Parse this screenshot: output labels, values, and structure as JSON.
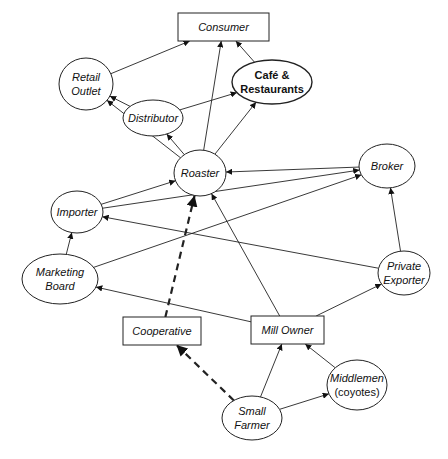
{
  "diagram": {
    "nodes": [
      {
        "id": "consumer",
        "label": [
          "Consumer"
        ],
        "shape": "rect",
        "x": 178,
        "y": 13,
        "w": 91,
        "h": 28,
        "style": "italic"
      },
      {
        "id": "retail",
        "label": [
          "Retail",
          "Outlet"
        ],
        "shape": "ellipse",
        "cx": 86,
        "cy": 84,
        "rx": 27,
        "ry": 26,
        "style": "italic"
      },
      {
        "id": "cafe",
        "label": [
          "Café &",
          "Restaurants"
        ],
        "shape": "ellipse",
        "cx": 272,
        "cy": 82,
        "rx": 40,
        "ry": 22,
        "style": "bold"
      },
      {
        "id": "distributor",
        "label": [
          "Distributor"
        ],
        "shape": "ellipse",
        "cx": 153,
        "cy": 118,
        "rx": 30,
        "ry": 18,
        "style": "italic"
      },
      {
        "id": "roaster",
        "label": [
          "Roaster"
        ],
        "shape": "ellipse",
        "cx": 200,
        "cy": 173,
        "rx": 26,
        "ry": 23,
        "style": "italic"
      },
      {
        "id": "broker",
        "label": [
          "Broker"
        ],
        "shape": "ellipse",
        "cx": 387,
        "cy": 166,
        "rx": 28,
        "ry": 22,
        "style": "italic"
      },
      {
        "id": "importer",
        "label": [
          "Importer"
        ],
        "shape": "ellipse",
        "cx": 77,
        "cy": 212,
        "rx": 26,
        "ry": 21,
        "style": "italic"
      },
      {
        "id": "marketing",
        "label": [
          "Marketing",
          "Board"
        ],
        "shape": "ellipse",
        "cx": 60,
        "cy": 279,
        "rx": 38,
        "ry": 25,
        "style": "italic"
      },
      {
        "id": "exporter",
        "label": [
          "Private",
          "Exporter"
        ],
        "shape": "ellipse",
        "cx": 404,
        "cy": 273,
        "rx": 26,
        "ry": 22,
        "style": "italic"
      },
      {
        "id": "cooperative",
        "label": [
          "Cooperative"
        ],
        "shape": "rect",
        "x": 123,
        "y": 317,
        "w": 78,
        "h": 28,
        "style": "italic"
      },
      {
        "id": "millowner",
        "label": [
          "Mill Owner"
        ],
        "shape": "rect",
        "x": 251,
        "y": 316,
        "w": 73,
        "h": 28,
        "style": "italic"
      },
      {
        "id": "middlemen",
        "label": [
          "Middlemen",
          "(coyotes)"
        ],
        "shape": "ellipse",
        "cx": 357,
        "cy": 385,
        "rx": 30,
        "ry": 25,
        "style": "plain-mixed"
      },
      {
        "id": "farmer",
        "label": [
          "Small",
          "Farmer"
        ],
        "shape": "ellipse",
        "cx": 252,
        "cy": 418,
        "rx": 30,
        "ry": 22,
        "style": "italic"
      }
    ],
    "edges": [
      {
        "from": "retail",
        "to": "consumer",
        "dashed": false
      },
      {
        "from": "roaster",
        "to": "consumer",
        "dashed": false
      },
      {
        "from": "cafe",
        "to": "consumer",
        "dashed": false
      },
      {
        "from": "distributor",
        "to": "retail",
        "dashed": false
      },
      {
        "from": "distributor",
        "to": "cafe",
        "dashed": false
      },
      {
        "from": "roaster",
        "to": "retail",
        "dashed": false
      },
      {
        "from": "roaster",
        "to": "distributor",
        "dashed": false
      },
      {
        "from": "roaster",
        "to": "cafe",
        "dashed": false
      },
      {
        "from": "broker",
        "to": "roaster",
        "dashed": false
      },
      {
        "from": "importer",
        "to": "roaster",
        "dashed": false
      },
      {
        "from": "importer",
        "to": "broker",
        "dashed": false
      },
      {
        "from": "marketing",
        "to": "broker",
        "dashed": false
      },
      {
        "from": "marketing",
        "to": "importer",
        "dashed": false
      },
      {
        "from": "exporter",
        "to": "importer",
        "dashed": false
      },
      {
        "from": "exporter",
        "to": "broker",
        "dashed": false
      },
      {
        "from": "millowner",
        "to": "marketing",
        "dashed": false
      },
      {
        "from": "millowner",
        "to": "roaster",
        "dashed": false
      },
      {
        "from": "millowner",
        "to": "exporter",
        "dashed": false
      },
      {
        "from": "cooperative",
        "to": "roaster",
        "dashed": true
      },
      {
        "from": "farmer",
        "to": "cooperative",
        "dashed": true
      },
      {
        "from": "farmer",
        "to": "millowner",
        "dashed": false
      },
      {
        "from": "farmer",
        "to": "middlemen",
        "dashed": false
      },
      {
        "from": "middlemen",
        "to": "millowner",
        "dashed": false
      }
    ]
  }
}
